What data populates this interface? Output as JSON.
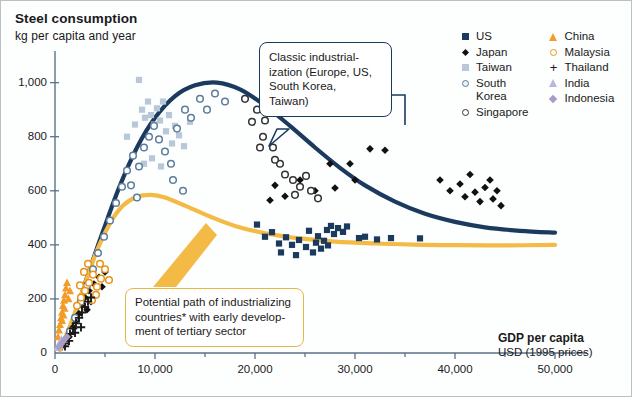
{
  "header": {
    "title": "Steel consumption",
    "subtitle": "kg per capita and year"
  },
  "xaxis_title": {
    "line1": "GDP per capita",
    "line2": "USD (1995 prices)"
  },
  "legend": {
    "column1": [
      {
        "label": "US",
        "marker": "filled-square-icon",
        "color": "#1b3a5e"
      },
      {
        "label": "Japan",
        "marker": "filled-diamond-icon",
        "color": "#111111"
      },
      {
        "label": "Taiwan",
        "marker": "filled-square-icon",
        "color": "#b9c8d8"
      },
      {
        "label": "South\nKorea",
        "marker": "open-circle-icon",
        "color": "#5c7d9c"
      },
      {
        "label": "Singapore",
        "marker": "open-circle-icon",
        "color": "#333333"
      }
    ],
    "column2": [
      {
        "label": "China",
        "marker": "filled-triangle-icon",
        "color": "#f39c2a"
      },
      {
        "label": "Malaysia",
        "marker": "open-circle-icon",
        "color": "#e8941b"
      },
      {
        "label": "Thailand",
        "marker": "plus-icon",
        "color": "#1a1a1a"
      },
      {
        "label": "India",
        "marker": "filled-triangle-icon",
        "color": "#b6b9d8"
      },
      {
        "label": "Indonesia",
        "marker": "filled-diamond-icon",
        "color": "#a99cc4"
      }
    ]
  },
  "callouts": {
    "classic": "Classic industrial-\nization (Europe, US,\nSouth Korea,\nTaiwan)",
    "potential": "Potential path of industrializing\ncountries* with early develop-\nment of tertiary sector"
  },
  "chart_data": {
    "type": "scatter",
    "title": "Steel consumption",
    "subtitle": "kg per capita and year",
    "xlabel": "GDP per capita USD (1995 prices)",
    "ylabel": "kg per capita and year",
    "xlim": [
      0,
      52000
    ],
    "ylim": [
      0,
      1080
    ],
    "xticks": [
      0,
      10000,
      20000,
      30000,
      40000,
      50000
    ],
    "xtick_labels": [
      "0",
      "10,000",
      "20,000",
      "30,000",
      "40,000",
      "50,000"
    ],
    "xminor_step": 5000,
    "yticks": [
      0,
      200,
      400,
      600,
      800,
      1000
    ],
    "ytick_labels": [
      "0",
      "200",
      "400",
      "600",
      "800",
      "1,000"
    ],
    "grid": false,
    "legend_position": "top-right",
    "curves": [
      {
        "name": "Classic industrialization path",
        "color": "#1b3a5e",
        "width": 4.2,
        "points": [
          [
            600,
            15
          ],
          [
            1800,
            120
          ],
          [
            3200,
            280
          ],
          [
            4800,
            450
          ],
          [
            6500,
            620
          ],
          [
            8200,
            760
          ],
          [
            10000,
            870
          ],
          [
            12000,
            950
          ],
          [
            14000,
            990
          ],
          [
            16200,
            1000
          ],
          [
            18500,
            975
          ],
          [
            21000,
            915
          ],
          [
            23500,
            840
          ],
          [
            26000,
            760
          ],
          [
            28500,
            685
          ],
          [
            31000,
            620
          ],
          [
            34000,
            560
          ],
          [
            37000,
            515
          ],
          [
            40000,
            485
          ],
          [
            43000,
            465
          ],
          [
            46500,
            452
          ],
          [
            50000,
            445
          ]
        ]
      },
      {
        "name": "Potential path of industrializing countries",
        "color": "#f3bb45",
        "width": 4.2,
        "points": [
          [
            500,
            10
          ],
          [
            1600,
            110
          ],
          [
            2900,
            245
          ],
          [
            4200,
            380
          ],
          [
            5500,
            480
          ],
          [
            6800,
            545
          ],
          [
            8200,
            578
          ],
          [
            9600,
            585
          ],
          [
            11000,
            575
          ],
          [
            13000,
            545
          ],
          [
            15500,
            505
          ],
          [
            18000,
            470
          ],
          [
            21000,
            443
          ],
          [
            24500,
            424
          ],
          [
            28000,
            412
          ],
          [
            32000,
            405
          ],
          [
            36000,
            401
          ],
          [
            40000,
            399
          ],
          [
            45000,
            398
          ],
          [
            50000,
            400
          ]
        ]
      }
    ],
    "series": [
      {
        "name": "US",
        "marker": "filled-square",
        "color": "#1b3a5e",
        "points": [
          [
            20200,
            475
          ],
          [
            21000,
            430
          ],
          [
            21700,
            447
          ],
          [
            22400,
            405
          ],
          [
            23100,
            428
          ],
          [
            23700,
            400
          ],
          [
            24400,
            418
          ],
          [
            25100,
            392
          ],
          [
            25400,
            452
          ],
          [
            25800,
            372
          ],
          [
            26100,
            408
          ],
          [
            26300,
            432
          ],
          [
            26600,
            386
          ],
          [
            26900,
            415
          ],
          [
            27200,
            455
          ],
          [
            27600,
            470
          ],
          [
            27900,
            440
          ],
          [
            28300,
            462
          ],
          [
            28800,
            448
          ],
          [
            29200,
            468
          ],
          [
            30400,
            425
          ],
          [
            31000,
            430
          ],
          [
            32200,
            420
          ],
          [
            33600,
            425
          ],
          [
            36500,
            424
          ],
          [
            24100,
            362
          ],
          [
            22600,
            372
          ],
          [
            27300,
            398
          ]
        ]
      },
      {
        "name": "Japan",
        "marker": "filled-diamond",
        "color": "#111111",
        "points": [
          [
            1400,
            60
          ],
          [
            1800,
            95
          ],
          [
            2100,
            120
          ],
          [
            2400,
            145
          ],
          [
            2700,
            175
          ],
          [
            3000,
            205
          ],
          [
            3200,
            160
          ],
          [
            3400,
            230
          ],
          [
            3600,
            190
          ],
          [
            3900,
            255
          ],
          [
            4100,
            215
          ],
          [
            4400,
            280
          ],
          [
            4700,
            245
          ],
          [
            5000,
            300
          ],
          [
            24500,
            640
          ],
          [
            26000,
            600
          ],
          [
            27500,
            700
          ],
          [
            29500,
            700
          ],
          [
            31500,
            755
          ],
          [
            33000,
            750
          ],
          [
            28000,
            610
          ],
          [
            30000,
            640
          ],
          [
            38500,
            640
          ],
          [
            39500,
            600
          ],
          [
            40500,
            625
          ],
          [
            41000,
            578
          ],
          [
            41500,
            660
          ],
          [
            42000,
            595
          ],
          [
            42500,
            560
          ],
          [
            43000,
            612
          ],
          [
            43500,
            640
          ],
          [
            43800,
            570
          ],
          [
            44200,
            600
          ],
          [
            44600,
            545
          ],
          [
            22000,
            620
          ],
          [
            23000,
            580
          ],
          [
            21500,
            565
          ]
        ]
      },
      {
        "name": "Taiwan",
        "marker": "filled-square",
        "color": "#b9c8d8",
        "points": [
          [
            7200,
            800
          ],
          [
            8000,
            845
          ],
          [
            8400,
            1010
          ],
          [
            8700,
            900
          ],
          [
            9000,
            870
          ],
          [
            9300,
            930
          ],
          [
            9600,
            880
          ],
          [
            9900,
            845
          ],
          [
            10200,
            905
          ],
          [
            10500,
            860
          ],
          [
            10800,
            930
          ],
          [
            11100,
            820
          ],
          [
            11400,
            880
          ],
          [
            11700,
            775
          ],
          [
            12000,
            840
          ],
          [
            12400,
            805
          ],
          [
            12900,
            765
          ],
          [
            13500,
            855
          ],
          [
            8900,
            700
          ],
          [
            9700,
            720
          ],
          [
            10600,
            690
          ]
        ]
      },
      {
        "name": "South Korea",
        "marker": "open-circle",
        "color": "#5c7d9c",
        "points": [
          [
            1500,
            80
          ],
          [
            2000,
            130
          ],
          [
            2600,
            190
          ],
          [
            3200,
            250
          ],
          [
            3800,
            310
          ],
          [
            4300,
            370
          ],
          [
            4900,
            430
          ],
          [
            5500,
            490
          ],
          [
            6100,
            555
          ],
          [
            6700,
            615
          ],
          [
            7200,
            675
          ],
          [
            7800,
            730
          ],
          [
            8400,
            690
          ],
          [
            8900,
            760
          ],
          [
            9400,
            800
          ],
          [
            9900,
            840
          ],
          [
            10400,
            790
          ],
          [
            11000,
            745
          ],
          [
            11600,
            700
          ],
          [
            12200,
            830
          ],
          [
            13000,
            900
          ],
          [
            13600,
            870
          ],
          [
            14500,
            940
          ],
          [
            15200,
            900
          ],
          [
            16000,
            960
          ],
          [
            17000,
            930
          ],
          [
            11800,
            640
          ],
          [
            12800,
            600
          ],
          [
            7600,
            620
          ],
          [
            8200,
            575
          ]
        ]
      },
      {
        "name": "Singapore",
        "marker": "open-circle",
        "color": "#333333",
        "points": [
          [
            19000,
            940
          ],
          [
            20200,
            900
          ],
          [
            21000,
            860
          ],
          [
            19700,
            855
          ],
          [
            20800,
            800
          ],
          [
            21800,
            760
          ],
          [
            22500,
            700
          ],
          [
            23000,
            660
          ],
          [
            23800,
            640
          ],
          [
            24500,
            615
          ],
          [
            25100,
            655
          ],
          [
            22000,
            715
          ],
          [
            24000,
            585
          ],
          [
            25600,
            600
          ],
          [
            26300,
            572
          ],
          [
            20500,
            760
          ]
        ]
      },
      {
        "name": "China",
        "marker": "filled-triangle",
        "color": "#f39c2a",
        "points": [
          [
            300,
            60
          ],
          [
            400,
            85
          ],
          [
            500,
            105
          ],
          [
            600,
            130
          ],
          [
            700,
            150
          ],
          [
            800,
            175
          ],
          [
            900,
            195
          ],
          [
            1000,
            215
          ],
          [
            1100,
            240
          ],
          [
            1200,
            260
          ],
          [
            1350,
            200
          ],
          [
            1500,
            230
          ],
          [
            700,
            120
          ],
          [
            850,
            140
          ],
          [
            950,
            165
          ]
        ]
      },
      {
        "name": "Malaysia",
        "marker": "open-circle",
        "color": "#e8941b",
        "points": [
          [
            2200,
            175
          ],
          [
            2600,
            205
          ],
          [
            3000,
            230
          ],
          [
            3400,
            260
          ],
          [
            3800,
            290
          ],
          [
            4200,
            245
          ],
          [
            4600,
            275
          ],
          [
            5000,
            310
          ],
          [
            5400,
            270
          ],
          [
            2900,
            300
          ],
          [
            3300,
            330
          ],
          [
            3700,
            195
          ],
          [
            4100,
            215
          ],
          [
            4500,
            330
          ],
          [
            2500,
            250
          ]
        ]
      },
      {
        "name": "Thailand",
        "marker": "plus",
        "color": "#1a1a1a",
        "points": [
          [
            900,
            35
          ],
          [
            1200,
            55
          ],
          [
            1500,
            70
          ],
          [
            1800,
            90
          ],
          [
            2100,
            110
          ],
          [
            2400,
            130
          ],
          [
            2700,
            150
          ],
          [
            3000,
            170
          ],
          [
            3300,
            190
          ],
          [
            3600,
            205
          ],
          [
            1000,
            25
          ],
          [
            1400,
            45
          ],
          [
            2000,
            75
          ],
          [
            2600,
            95
          ]
        ]
      },
      {
        "name": "India",
        "marker": "filled-triangle",
        "color": "#b6b9d8",
        "points": [
          [
            250,
            20
          ],
          [
            350,
            28
          ],
          [
            450,
            35
          ],
          [
            550,
            42
          ],
          [
            650,
            50
          ]
        ]
      },
      {
        "name": "Indonesia",
        "marker": "filled-diamond",
        "color": "#a99cc4",
        "points": [
          [
            400,
            22
          ],
          [
            600,
            32
          ],
          [
            800,
            42
          ],
          [
            1000,
            52
          ],
          [
            1200,
            60
          ]
        ]
      }
    ]
  }
}
